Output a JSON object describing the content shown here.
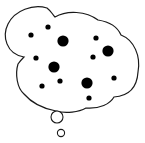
{
  "image": {
    "subject": "thought-bubble",
    "stroke_color": "#1a1a1a",
    "fill_color": "#ffffff",
    "dot_color": "#000000"
  },
  "dots": [
    {
      "cx": 31,
      "cy": 35,
      "r": 2.6
    },
    {
      "cx": 48,
      "cy": 27,
      "r": 2.6
    },
    {
      "cx": 63,
      "cy": 41,
      "r": 5.6
    },
    {
      "cx": 96,
      "cy": 38,
      "r": 2.6
    },
    {
      "cx": 108,
      "cy": 51,
      "r": 5.6
    },
    {
      "cx": 36,
      "cy": 58,
      "r": 2.6
    },
    {
      "cx": 93,
      "cy": 57,
      "r": 2.6
    },
    {
      "cx": 54,
      "cy": 67,
      "r": 5.6
    },
    {
      "cx": 114,
      "cy": 78,
      "r": 2.6
    },
    {
      "cx": 60,
      "cy": 81,
      "r": 2.6
    },
    {
      "cx": 42,
      "cy": 86,
      "r": 2.6
    },
    {
      "cx": 87,
      "cy": 83,
      "r": 5.6
    },
    {
      "cx": 89,
      "cy": 98,
      "r": 2.6
    }
  ],
  "trail_bubbles": [
    {
      "cx": 57,
      "cy": 117,
      "r": 6
    },
    {
      "cx": 61,
      "cy": 133,
      "r": 3.6
    }
  ]
}
